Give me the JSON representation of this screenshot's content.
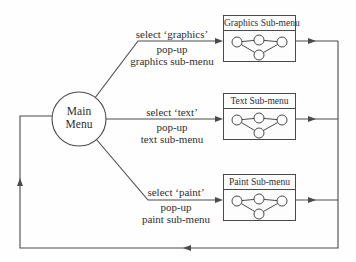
{
  "colors": {
    "background": "#fefefe",
    "line": "#4a4a4a",
    "text": "#2f2f2f",
    "node_fill": "#ffffff"
  },
  "main_menu": {
    "line1": "Main",
    "line2": "Menu"
  },
  "branches": [
    {
      "select": "select ‘graphics’",
      "popup": "pop-up",
      "submenu": "graphics sub-menu",
      "box_title": "Graphics Sub-menu"
    },
    {
      "select": "select ‘text’",
      "popup": "pop-up",
      "submenu": "text sub-menu",
      "box_title": "Text Sub-menu"
    },
    {
      "select": "select ‘paint’",
      "popup": "pop-up",
      "submenu": "paint sub-menu",
      "box_title": "Paint Sub-menu"
    }
  ]
}
